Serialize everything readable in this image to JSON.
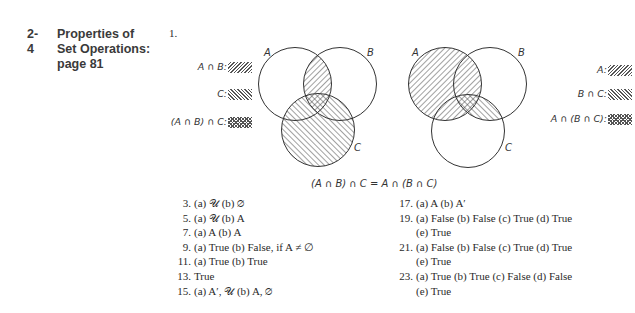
{
  "section": {
    "number": "2-4",
    "title_line1": "Properties of",
    "title_line2": "Set Operations:",
    "title_line3": "page 81"
  },
  "problem1": {
    "label": "1.",
    "left_diagram": {
      "circle_labels": [
        "A",
        "B",
        "C"
      ],
      "legend": [
        {
          "text": "A ∩ B:",
          "pattern": "forward-hatch"
        },
        {
          "text": "C:",
          "pattern": "back-hatch"
        },
        {
          "text": "(A ∩ B) ∩ C:",
          "pattern": "cross-hatch"
        }
      ]
    },
    "right_diagram": {
      "circle_labels": [
        "A",
        "B",
        "C"
      ],
      "legend": [
        {
          "text": "A:",
          "pattern": "forward-hatch"
        },
        {
          "text": "B ∩ C:",
          "pattern": "back-hatch"
        },
        {
          "text": "A ∩ (B ∩ C):",
          "pattern": "cross-hatch"
        }
      ]
    },
    "equation": "(A ∩ B) ∩ C = A ∩ (B ∩ C)"
  },
  "answers_left": [
    {
      "num": "3.",
      "line1": "(a) 𝒰 (b) ∅"
    },
    {
      "num": "5.",
      "line1": "(a) 𝒰 (b) A"
    },
    {
      "num": "7.",
      "line1": "(a) A (b) A"
    },
    {
      "num": "9.",
      "line1": "(a) True (b) False, if A ≠ ∅"
    },
    {
      "num": "11.",
      "line1": "(a) True (b) True"
    },
    {
      "num": "13.",
      "line1": "True"
    },
    {
      "num": "15.",
      "line1": "(a) A′, 𝒰 (b) A, ∅"
    }
  ],
  "answers_right": [
    {
      "num": "17.",
      "line1": "(a) A (b) A′"
    },
    {
      "num": "19.",
      "line1": "(a) False (b) False (c) True (d) True",
      "line2": "(e) True"
    },
    {
      "num": "21.",
      "line1": "(a) False (b) False (c) True (d) True",
      "line2": "(e) True"
    },
    {
      "num": "23.",
      "line1": "(a) True (b) True (c) False (d) False",
      "line2": "(e) True"
    }
  ]
}
